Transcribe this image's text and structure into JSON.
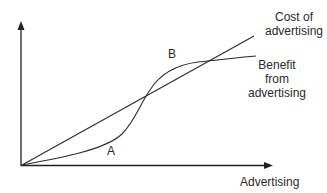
{
  "diagram": {
    "x_axis_label": "Advertising",
    "y_axis_label": "",
    "curves": [
      {
        "id": "cost",
        "label_lines": [
          "Cost of",
          "advertising"
        ],
        "shape": "straight line from origin"
      },
      {
        "id": "benefit",
        "label_lines": [
          "Benefit",
          "from",
          "advertising"
        ],
        "shape": "S-curve from origin"
      }
    ],
    "regions": [
      {
        "id": "A",
        "label": "A",
        "description": "area where cost exceeds benefit"
      },
      {
        "id": "B",
        "label": "B",
        "description": "area where benefit exceeds cost"
      }
    ],
    "colors": {
      "line": "#2a2a2a",
      "axis": "#222222",
      "background": "#ffffff"
    }
  }
}
